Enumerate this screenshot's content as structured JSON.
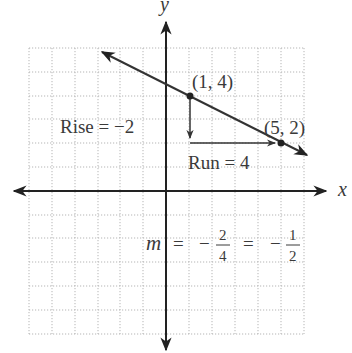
{
  "diagram": {
    "axes": {
      "x_label": "x",
      "y_label": "y"
    },
    "points": [
      {
        "label": "(1, 4)",
        "x": 1,
        "y": 4
      },
      {
        "label": "(5, 2)",
        "x": 5,
        "y": 2
      }
    ],
    "rise_label": "Rise = −2",
    "run_label": "Run = 4",
    "slope": {
      "var": "m",
      "eq1": "=",
      "minus1": "−",
      "frac1_num": "2",
      "frac1_den": "4",
      "eq2": "=",
      "minus2": "−",
      "frac2_num": "1",
      "frac2_den": "2"
    },
    "grid_range": {
      "x": [
        -6,
        6
      ],
      "y": [
        -6,
        6
      ]
    },
    "colors": {
      "line": "#333333",
      "grid": "#b5b5b5",
      "text": "#3a3a3a"
    }
  }
}
